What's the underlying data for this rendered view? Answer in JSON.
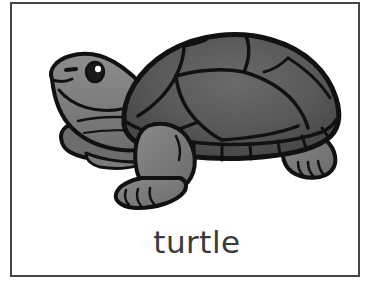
{
  "card": {
    "type": "picture-word-flashcard",
    "caption": "turtle",
    "border_color": "#454545",
    "background_color": "#ffffff",
    "caption_color": "#3b3b3b"
  },
  "illustration": {
    "subject": "turtle",
    "style": "clip-art line drawing, grayscale",
    "outline_color": "#111111",
    "shell_color": "#5a5a5a",
    "shell_shade_color": "#4a4a4a",
    "skin_color": "#858585",
    "skin_shade_color": "#6d6d6d",
    "eye_color": "#1a1a1a",
    "eye_highlight_color": "#ffffff",
    "parts": [
      "shell-carapace",
      "marginal-scutes",
      "head",
      "eye",
      "nostril",
      "mouth",
      "neck",
      "front-leg",
      "rear-leg",
      "plastron",
      "tail"
    ]
  }
}
